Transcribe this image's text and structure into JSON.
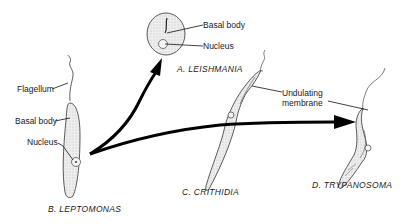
{
  "diagram": {
    "organisms": [
      {
        "id": "A",
        "caption": "A. LEISHMANIA",
        "labels": [
          "Basal body",
          "Nucleus"
        ]
      },
      {
        "id": "B",
        "caption": "B. LEPTOMONAS",
        "labels": [
          "Flagellum",
          "Basal body",
          "Nucleus"
        ]
      },
      {
        "id": "C",
        "caption": "C. CRITHIDIA",
        "labels": []
      },
      {
        "id": "D",
        "caption": "D. TRYPANOSOMA",
        "labels": []
      }
    ],
    "shared_labels": {
      "undulating_membrane_line1": "Undulating",
      "undulating_membrane_line2": "membrane"
    },
    "arrows": [
      {
        "from": "B",
        "to": "A"
      },
      {
        "from": "B",
        "to": "D",
        "via": "C"
      }
    ],
    "colors": {
      "ink": "#111111",
      "cell_fill": "#e6e6e6",
      "background": "#ffffff"
    }
  }
}
